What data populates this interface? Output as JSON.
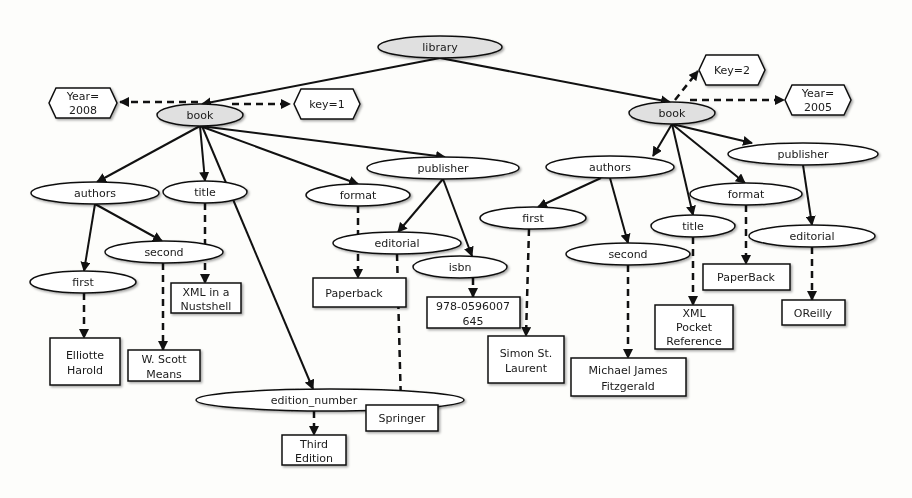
{
  "diagram": {
    "type": "xml-tree",
    "root": {
      "id": "library",
      "label": "library"
    },
    "attributes": [
      {
        "id": "year2008",
        "lines": [
          "Year=",
          "2008"
        ],
        "parent": "book1"
      },
      {
        "id": "key1",
        "lines": [
          "key=1"
        ],
        "parent": "book1"
      },
      {
        "id": "key2",
        "lines": [
          "Key=2"
        ],
        "parent": "book2"
      },
      {
        "id": "year2005",
        "lines": [
          "Year=",
          "2005"
        ],
        "parent": "book2"
      }
    ],
    "elements": [
      {
        "id": "book1",
        "label": "book",
        "parent": "library",
        "shaded": true
      },
      {
        "id": "book2",
        "label": "book",
        "parent": "library",
        "shaded": true
      },
      {
        "id": "authors1",
        "label": "authors",
        "parent": "book1"
      },
      {
        "id": "title1",
        "label": "title",
        "parent": "book1"
      },
      {
        "id": "format1",
        "label": "format",
        "parent": "book1"
      },
      {
        "id": "publisher1",
        "label": "publisher",
        "parent": "book1"
      },
      {
        "id": "edition1",
        "label": "edition_number",
        "parent": "book1"
      },
      {
        "id": "first1",
        "label": "first",
        "parent": "authors1"
      },
      {
        "id": "second1",
        "label": "second",
        "parent": "authors1"
      },
      {
        "id": "editorial1",
        "label": "editorial",
        "parent": "publisher1"
      },
      {
        "id": "isbn1",
        "label": "isbn",
        "parent": "publisher1"
      },
      {
        "id": "authors2",
        "label": "authors",
        "parent": "book2"
      },
      {
        "id": "title2",
        "label": "title",
        "parent": "book2"
      },
      {
        "id": "format2",
        "label": "format",
        "parent": "book2"
      },
      {
        "id": "publisher2",
        "label": "publisher",
        "parent": "book2"
      },
      {
        "id": "first2",
        "label": "first",
        "parent": "authors2"
      },
      {
        "id": "second2",
        "label": "second",
        "parent": "authors2"
      },
      {
        "id": "editorial2",
        "label": "editorial",
        "parent": "publisher2"
      }
    ],
    "values": [
      {
        "id": "v_title1",
        "lines": [
          "XML in a",
          "Nustshell"
        ],
        "parent": "title1"
      },
      {
        "id": "v_first1",
        "lines": [
          "Elliotte",
          "Harold"
        ],
        "parent": "first1"
      },
      {
        "id": "v_second1",
        "lines": [
          "W. Scott",
          "Means"
        ],
        "parent": "second1"
      },
      {
        "id": "v_format1",
        "lines": [
          "Paperback"
        ],
        "parent": "format1"
      },
      {
        "id": "v_editorial1",
        "lines": [
          "Springer"
        ],
        "parent": "editorial1"
      },
      {
        "id": "v_isbn1",
        "lines": [
          "978-0596007",
          "645"
        ],
        "parent": "isbn1"
      },
      {
        "id": "v_edition1",
        "lines": [
          "Third",
          "Edition"
        ],
        "parent": "edition1"
      },
      {
        "id": "v_first2",
        "lines": [
          "Simon St.",
          "Laurent"
        ],
        "parent": "first2"
      },
      {
        "id": "v_second2",
        "lines": [
          "Michael James",
          "Fitzgerald"
        ],
        "parent": "second2"
      },
      {
        "id": "v_title2",
        "lines": [
          "XML",
          "Pocket",
          "Reference"
        ],
        "parent": "title2"
      },
      {
        "id": "v_format2",
        "lines": [
          "PaperBack"
        ],
        "parent": "format2"
      },
      {
        "id": "v_editorial2",
        "lines": [
          "OReilly"
        ],
        "parent": "editorial2"
      }
    ],
    "colors": {
      "background": "#fdfdfb",
      "stroke": "#111111",
      "shaded_fill": "#e0e0e0",
      "fill": "#ffffff"
    }
  }
}
